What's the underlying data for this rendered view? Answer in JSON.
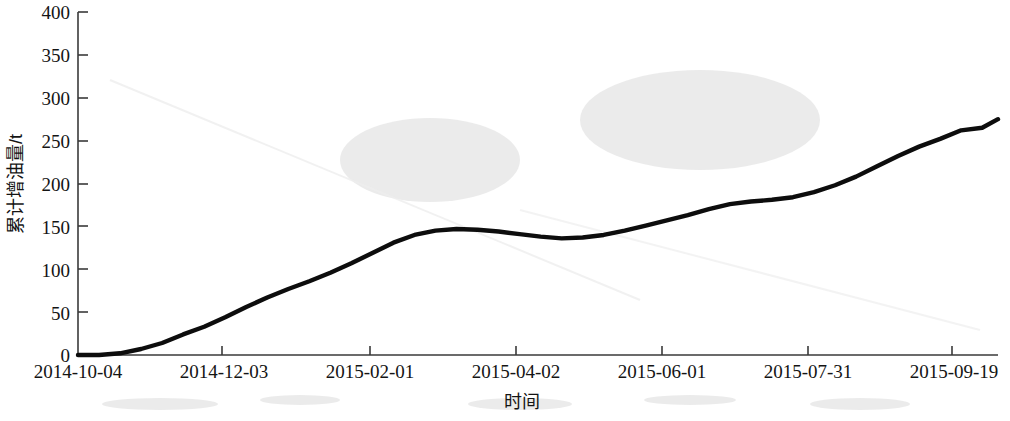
{
  "chart_data": {
    "type": "line",
    "title": "",
    "xlabel": "时间",
    "ylabel": "累计增油量/t",
    "ylim": [
      0,
      400
    ],
    "yticks": [
      0,
      50,
      100,
      150,
      200,
      250,
      300,
      350,
      400
    ],
    "ytick_labels": [
      "0",
      "50",
      "100",
      "150",
      "200",
      "250",
      "300",
      "350",
      "400"
    ],
    "xtick_labels": [
      "2014-10-04",
      "2014-12-03",
      "2015-02-01",
      "2015-04-02",
      "2015-06-01",
      "2015-07-31",
      "2015-09-19"
    ],
    "xlim_days": [
      0,
      350
    ],
    "xtick_days": [
      0,
      60,
      120,
      180,
      240,
      300,
      350
    ],
    "grid": false,
    "legend": null,
    "series": [
      {
        "name": "累计增油量",
        "color": "#0d0d0d",
        "x_days": [
          0,
          6,
          12,
          20,
          30,
          38,
          45,
          52,
          60,
          68,
          76,
          84,
          92,
          100,
          108,
          116,
          122,
          128,
          136,
          144,
          152,
          160,
          168,
          176,
          184,
          192,
          200,
          208,
          216,
          224,
          232,
          240,
          248,
          256,
          264,
          272,
          280,
          288,
          296,
          304,
          312,
          320,
          328,
          336,
          344,
          350
        ],
        "values": [
          0,
          0,
          1,
          4,
          10,
          18,
          28,
          35,
          48,
          60,
          70,
          79,
          88,
          98,
          110,
          123,
          133,
          141,
          146,
          147,
          146,
          145,
          143,
          140,
          137,
          136,
          137,
          140,
          144,
          149,
          154,
          159,
          165,
          171,
          176,
          179,
          180,
          181,
          186,
          191,
          200,
          210,
          221,
          232,
          242,
          248
        ],
        "values_tail_x_days": [
          350,
          356,
          364,
          372,
          380,
          388,
          396,
          404,
          412,
          420
        ],
        "values_tail": [
          248,
          252,
          258,
          262,
          264,
          265,
          272,
          282,
          292,
          300
        ]
      }
    ],
    "data_points_full": {
      "x_days": [
        0,
        8,
        16,
        24,
        32,
        40,
        48,
        56,
        64,
        72,
        80,
        88,
        96,
        104,
        112,
        120,
        128,
        136,
        144,
        152,
        160,
        168,
        176,
        184,
        192,
        200,
        208,
        216,
        224,
        232,
        240,
        248,
        256,
        264,
        272,
        280,
        288,
        296,
        304,
        312,
        320,
        328,
        336,
        344,
        350
      ],
      "y_values": [
        0,
        0,
        2,
        7,
        14,
        24,
        33,
        44,
        56,
        67,
        77,
        86,
        96,
        107,
        119,
        131,
        140,
        145,
        147,
        146,
        144,
        141,
        138,
        136,
        137,
        140,
        145,
        151,
        157,
        163,
        170,
        176,
        179,
        181,
        184,
        190,
        198,
        208,
        220,
        232,
        243,
        252,
        262,
        265,
        275
      ]
    }
  },
  "axis": {
    "y_axis_name": "y-axis",
    "x_axis_name": "x-axis"
  },
  "artifacts": {
    "bottom_smudge_left": "",
    "bottom_smudge_mid": "",
    "bottom_smudge_right": ""
  }
}
